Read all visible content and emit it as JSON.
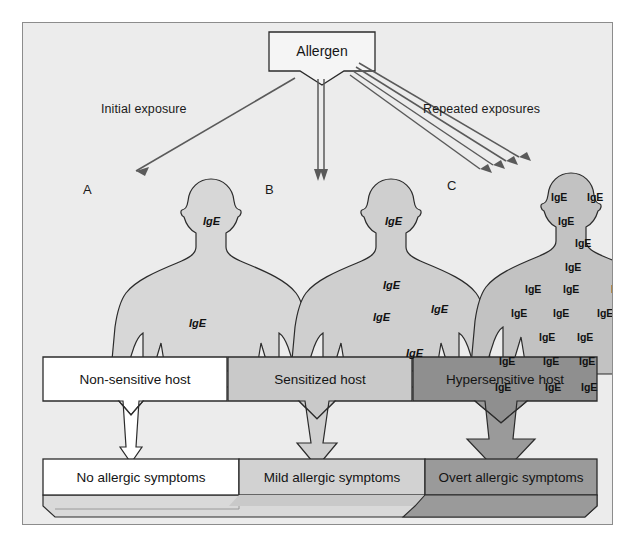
{
  "diagram": {
    "title_box": {
      "label": "Allergen",
      "shape": "flag-pentagon"
    },
    "exposure_labels": {
      "left": "Initial exposure",
      "right": "Repeated exposures"
    },
    "arrow_counts": {
      "to_a": 1,
      "to_b": 2,
      "to_c": 4
    },
    "figures": [
      {
        "id": "A",
        "letter": "A",
        "fill": "#d7d7d7",
        "ige_label": "IgE",
        "ige_count": 2,
        "ige_positions": [
          [
            62,
            40
          ],
          [
            48,
            142
          ]
        ]
      },
      {
        "id": "B",
        "letter": "B",
        "fill": "#cfcfcf",
        "ige_label": "IgE",
        "ige_count": 5,
        "ige_positions": [
          [
            64,
            40
          ],
          [
            62,
            104
          ],
          [
            52,
            136
          ],
          [
            110,
            128
          ],
          [
            85,
            172
          ]
        ]
      },
      {
        "id": "C",
        "letter": "C",
        "fill": "#c2c2c2",
        "ige_label": "IgE",
        "ige_count": 28,
        "ige_positions": [
          [
            50,
            22
          ],
          [
            86,
            22
          ],
          [
            57,
            46
          ],
          [
            74,
            68
          ],
          [
            64,
            92
          ],
          [
            24,
            114
          ],
          [
            62,
            114
          ],
          [
            110,
            114
          ],
          [
            10,
            138
          ],
          [
            52,
            138
          ],
          [
            96,
            138
          ],
          [
            133,
            138
          ],
          [
            38,
            162
          ],
          [
            76,
            162
          ],
          [
            116,
            162
          ],
          [
            150,
            162
          ],
          [
            -2,
            186
          ],
          [
            42,
            186
          ],
          [
            78,
            186
          ],
          [
            114,
            186
          ],
          [
            150,
            186
          ],
          [
            -6,
            212
          ],
          [
            44,
            212
          ],
          [
            80,
            212
          ],
          [
            114,
            212
          ],
          [
            152,
            212
          ]
        ]
      }
    ],
    "host_boxes": [
      {
        "id": "non-sensitive",
        "label": "Non-sensitive host",
        "fill": "#ffffff"
      },
      {
        "id": "sensitized",
        "label": "Sensitized host",
        "fill": "#c9c9c9"
      },
      {
        "id": "hypersensitive",
        "label": "Hypersensitive host",
        "fill": "#8f8f8f"
      }
    ],
    "transition_arrows": [
      {
        "from": "non-sensitive",
        "to": "sensitized",
        "fill": "#ffffff"
      },
      {
        "from": "sensitized",
        "to": "hypersensitive",
        "fill": "#ffffff"
      }
    ],
    "down_arrows": [
      {
        "id": "a-down",
        "fill": "#ffffff",
        "size": "small"
      },
      {
        "id": "b-down",
        "fill": "#cfcfcf",
        "size": "medium"
      },
      {
        "id": "c-down",
        "fill": "#9a9a9a",
        "size": "large"
      }
    ],
    "symptom_boxes": [
      {
        "id": "none",
        "label": "No allergic symptoms",
        "fill": "#ffffff"
      },
      {
        "id": "mild",
        "label": "Mild allergic symptoms",
        "fill": "#d2d2d2"
      },
      {
        "id": "overt",
        "label": "Overt allergic symptoms",
        "fill": "#9a9a9a"
      }
    ],
    "colors": {
      "background": "#ececec",
      "page": "#ffffff",
      "stroke": "#2b2b2b",
      "frame": "#8c8c8c",
      "light_gray": "#d7d7d7",
      "mid_gray": "#c2c2c2",
      "dark_gray": "#8f8f8f"
    }
  }
}
